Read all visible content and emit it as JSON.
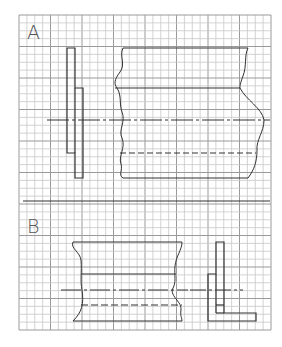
{
  "sheet": {
    "grid": {
      "x": 19,
      "y": 15,
      "cols": 32,
      "rows": 40,
      "cell": 7.875,
      "major_every": 4,
      "minor_color": "#c8c8c8",
      "major_color": "#9a9a9a"
    },
    "line_color": "#333333"
  },
  "exercises": [
    {
      "id": "A",
      "label": "A"
    },
    {
      "id": "B",
      "label": "B"
    }
  ]
}
